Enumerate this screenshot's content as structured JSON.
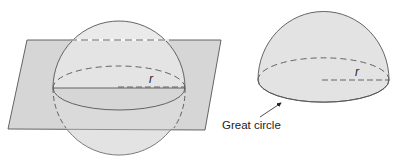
{
  "figures": [
    {
      "name": "sphere-intersected-by-plane",
      "labels": {
        "radius": "r"
      }
    },
    {
      "name": "hemisphere",
      "labels": {
        "radius": "r",
        "callout": "Great circle"
      }
    }
  ],
  "colors": {
    "plane_fill": "#d6d6d6",
    "sphere_fill": "#e3e3e3",
    "stroke": "#555555",
    "background": "#ffffff"
  }
}
